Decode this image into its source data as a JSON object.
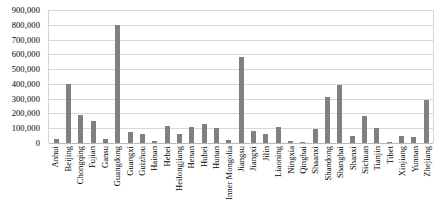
{
  "chart_data": {
    "type": "bar",
    "title": "",
    "xlabel": "",
    "ylabel": "",
    "ylim": [
      0,
      900000
    ],
    "grid": true,
    "legend": false,
    "bar_color": "#808080",
    "gridline_color": "#d9d9d9",
    "y_ticks": [
      "900,000",
      "800,000",
      "700,000",
      "600,000",
      "500,000",
      "400,000",
      "300,000",
      "200,000",
      "100,000",
      "0"
    ],
    "y_tick_values": [
      900000,
      800000,
      700000,
      600000,
      500000,
      400000,
      300000,
      200000,
      100000,
      0
    ],
    "categories": [
      "Anhui",
      "Beijing",
      "Chongqing",
      "Fujian",
      "Gansu",
      "Guangdong",
      "Guangxi",
      "Guizhou",
      "Hainan",
      "Hebei",
      "Heilongjiang",
      "Henan",
      "Hubei",
      "Hunan",
      "Inner Mongolia",
      "Jiangsu",
      "Jiangxi",
      "Jilin",
      "Liaoning",
      "Ningxia",
      "Qinghai",
      "Shaanxi",
      "Shandong",
      "Shanghai",
      "Shanxi",
      "Sichuan",
      "Tianjin",
      "Tibet",
      "Xinjiang",
      "Yunnan",
      "Zhejiang"
    ],
    "values": [
      30000,
      400000,
      190000,
      150000,
      25000,
      800000,
      75000,
      60000,
      15000,
      115000,
      60000,
      110000,
      130000,
      100000,
      20000,
      580000,
      80000,
      60000,
      110000,
      12000,
      10000,
      95000,
      310000,
      390000,
      45000,
      180000,
      100000,
      8000,
      50000,
      40000,
      290000
    ]
  }
}
